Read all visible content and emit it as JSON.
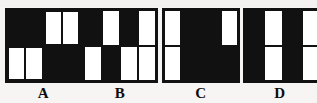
{
  "canvas": {
    "width": 317,
    "height": 103,
    "background_color": "#f6f5f3",
    "ink_color": "#111111",
    "paper_color": "#ffffff"
  },
  "figures": [
    {
      "id": "A",
      "label": "A",
      "layout": "2x2-quadrants",
      "description": "Two-by-two quadrant square: top-left solid black, top-right two white vertical bars, bottom-left two white vertical bars, bottom-right solid black.",
      "quadrants": [
        {
          "position": "top-left",
          "fill": "black",
          "bars": 0
        },
        {
          "position": "top-right",
          "fill": "white",
          "bars": 2
        },
        {
          "position": "bottom-left",
          "fill": "white",
          "bars": 2
        },
        {
          "position": "bottom-right",
          "fill": "black",
          "bars": 0
        }
      ]
    },
    {
      "id": "B",
      "label": "B",
      "layout": "4x2-grid",
      "description": "Four columns by two rows of tall cells in alternating black and white.",
      "rows": [
        [
          "black",
          "white",
          "black",
          "white"
        ],
        [
          "white",
          "black",
          "white",
          "white"
        ]
      ]
    },
    {
      "id": "C",
      "label": "C",
      "layout": "3-column-composite",
      "description": "Mostly black square with a white left column split into two cells and a white cell at the top right.",
      "cells": [
        {
          "position": "left-top",
          "fill": "white"
        },
        {
          "position": "center",
          "fill": "black",
          "row_span": 2
        },
        {
          "position": "right-top",
          "fill": "white"
        },
        {
          "position": "left-bottom",
          "fill": "white"
        },
        {
          "position": "right-bottom",
          "fill": "black"
        }
      ]
    },
    {
      "id": "D",
      "label": "D",
      "layout": "4x2-grid",
      "clipped": "right edge cut off by image border",
      "description": "Four columns by two rows alternating black and white, with a horizontal divider; clipped at the right edge of the image.",
      "rows": [
        [
          "black",
          "white",
          "black",
          "white"
        ],
        [
          "black",
          "white",
          "black",
          "white"
        ]
      ]
    }
  ]
}
